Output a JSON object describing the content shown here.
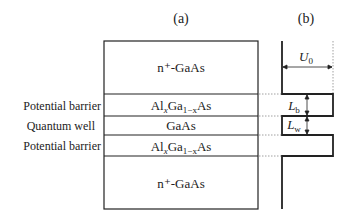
{
  "panels": {
    "a_label": "(a)",
    "b_label": "(b)"
  },
  "layers": [
    {
      "material": "n⁺-GaAs",
      "role": ""
    },
    {
      "material_parts": [
        "Al",
        "x",
        "Ga",
        "1−x",
        "As"
      ],
      "role": "Potential barrier"
    },
    {
      "material": "GaAs",
      "role": "Quantum well"
    },
    {
      "material_parts": [
        "Al",
        "x",
        "Ga",
        "1−x",
        "As"
      ],
      "role": "Potential barrier"
    },
    {
      "material": "n⁺-GaAs",
      "role": ""
    }
  ],
  "labels": {
    "barrier_top": "Potential barrier",
    "well": "Quantum well",
    "barrier_bottom": "Potential barrier",
    "top_contact": "n⁺-GaAs",
    "bottom_contact": "n⁺-GaAs",
    "well_material": "GaAs",
    "algaas": {
      "a": "Al",
      "x": "x",
      "b": "Ga",
      "sub": "1−x",
      "c": "As"
    }
  },
  "profile": {
    "U0": {
      "main": "U",
      "sub": "0"
    },
    "Lb": {
      "main": "L",
      "sub": "b"
    },
    "Lw": {
      "main": "L",
      "sub": "w"
    }
  }
}
